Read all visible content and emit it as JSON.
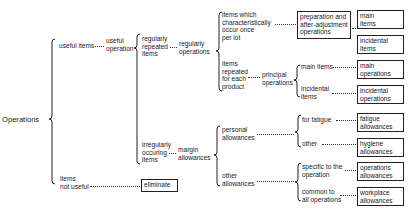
{
  "diagram": {
    "root": "Operations",
    "level1": {
      "useful_items": "useful items",
      "useful_operation": [
        "useful",
        "operation"
      ],
      "items_not_useful": [
        "items",
        "not useful"
      ],
      "eliminate": "eliminate"
    },
    "level2": {
      "regularly_repeated_items": [
        "regularly",
        "repeated",
        "items"
      ],
      "regularly_operations": [
        "regularly",
        "operations"
      ],
      "irregularly_occuring_items": [
        "irregularly",
        "occuring",
        "items"
      ],
      "margin_allowances": [
        "margin",
        "allowances"
      ]
    },
    "level3": {
      "once_per_lot": [
        "items which",
        "characteristically",
        "occur once",
        "per lot"
      ],
      "prep_box": [
        "preparation and",
        "after-adjustment",
        "operations"
      ],
      "repeated_each": [
        "items",
        "repeated",
        "for each",
        "product"
      ],
      "principal_operations": [
        "principal",
        "operations"
      ],
      "main_items": "main items",
      "incidental_items": [
        "incidental",
        "items"
      ],
      "personal_allowances": [
        "personal",
        "allowances"
      ],
      "other_allowances": [
        "other",
        "allowances"
      ],
      "for_fatigue": "for fatigue",
      "other": "other",
      "specific": [
        "specific to the",
        "operation"
      ],
      "common": [
        "common to",
        "all operations"
      ]
    },
    "boxes_right": {
      "main_items_box": [
        "main",
        "items"
      ],
      "incidental_items_box": [
        "incidental",
        "items"
      ],
      "main_operations_box": [
        "main",
        "operations"
      ],
      "incidental_operations_box": [
        "incidental",
        "operations"
      ],
      "fatigue_box": [
        "fatigue",
        "allowances"
      ],
      "hygiene_box": [
        "hygiene",
        "allowances"
      ],
      "operations_box": [
        "operations",
        "allowances"
      ],
      "workplace_box": [
        "workplace",
        "allowances"
      ]
    }
  }
}
